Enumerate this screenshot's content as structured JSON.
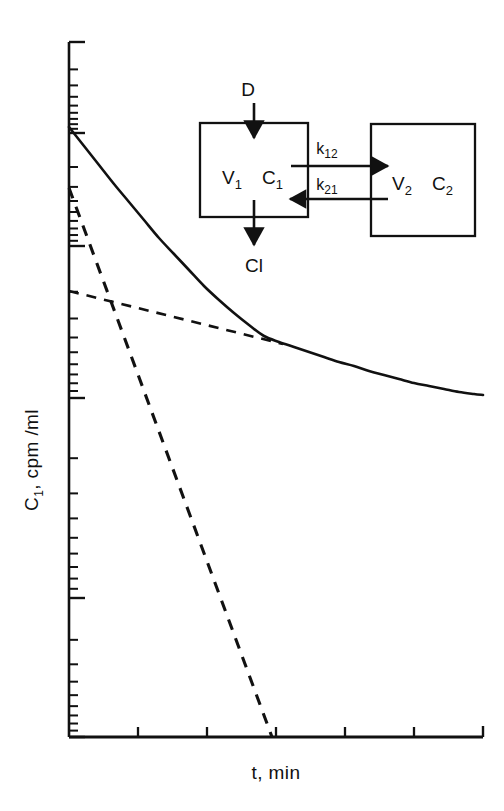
{
  "figure": {
    "background_color": "#ffffff",
    "ink_color": "#111111"
  },
  "axes": {
    "x_label": "t, min",
    "y_label": "C₁, cpm /ml",
    "y_label_main": "C",
    "y_label_sub": "1",
    "y_label_rest": ", cpm /ml",
    "x_tick_count": 5,
    "y_scale": "log",
    "x_scale": "linear",
    "origin_px": [
      69,
      737
    ],
    "x_axis_end_px": [
      483,
      737
    ],
    "y_axis_top_px": [
      69,
      42
    ]
  },
  "chart_data": {
    "type": "line",
    "title": "",
    "xlabel": "t, min",
    "ylabel": "C₁, cpm /ml",
    "y_scale": "log",
    "x_scale": "linear",
    "grid": false,
    "legend": "none",
    "xlim": [
      0,
      1
    ],
    "ylim_log_decades": 5,
    "series": [
      {
        "name": "C1 observed biexponential curve",
        "style": "solid",
        "points_px": [
          [
            69,
            127
          ],
          [
            84,
            146
          ],
          [
            99,
            165
          ],
          [
            114,
            184
          ],
          [
            129,
            202
          ],
          [
            144,
            220
          ],
          [
            159,
            238
          ],
          [
            174,
            254
          ],
          [
            189,
            270
          ],
          [
            204,
            286
          ],
          [
            219,
            300
          ],
          [
            234,
            313
          ],
          [
            249,
            325
          ],
          [
            264,
            336
          ],
          [
            279,
            342
          ],
          [
            294,
            347
          ],
          [
            309,
            352
          ],
          [
            324,
            357
          ],
          [
            339,
            362
          ],
          [
            354,
            366
          ],
          [
            369,
            371
          ],
          [
            384,
            375
          ],
          [
            399,
            379
          ],
          [
            414,
            383
          ],
          [
            429,
            386
          ],
          [
            444,
            389
          ],
          [
            459,
            392
          ],
          [
            474,
            394
          ],
          [
            483,
            395
          ]
        ]
      },
      {
        "name": "alpha distribution phase extrapolation",
        "style": "dashed",
        "points_px": [
          [
            69,
            188
          ],
          [
            272,
            737
          ]
        ]
      },
      {
        "name": "beta elimination phase extrapolation",
        "style": "dashed",
        "points_px": [
          [
            69,
            291
          ],
          [
            283,
            344
          ]
        ]
      }
    ],
    "annotations": [
      {
        "name": "intercept-A-alpha",
        "at_px": [
          69,
          188
        ],
        "note": "zero-time intercept of steep dashed line"
      },
      {
        "name": "intercept-B-beta",
        "at_px": [
          69,
          291
        ],
        "note": "zero-time intercept of shallow dashed line"
      },
      {
        "name": "curve-start",
        "at_px": [
          69,
          127
        ],
        "note": "initial concentration of solid curve"
      }
    ]
  },
  "y_ticks": {
    "long_tick_len": 16,
    "short_tick_len": 9,
    "decades_px": [
      42,
      133,
      246,
      398,
      598,
      737
    ],
    "minor_offsets": [
      0.301,
      0.477,
      0.602,
      0.699,
      0.778,
      0.845,
      0.903,
      0.954
    ]
  },
  "x_ticks": {
    "tick_len": 10,
    "positions_px": [
      138,
      207,
      276,
      345,
      414
    ]
  },
  "diagram": {
    "name": "two-compartment-model",
    "box1": {
      "label_volume": "V",
      "label_volume_sub": "1",
      "label_conc": "C",
      "label_conc_sub": "1",
      "rect_px": [
        200,
        123,
        108,
        94
      ]
    },
    "box2": {
      "label_volume": "V",
      "label_volume_sub": "2",
      "label_conc": "C",
      "label_conc_sub": "2",
      "rect_px": [
        371,
        124,
        104,
        112
      ]
    },
    "input": {
      "label": "D",
      "label_px": [
        248,
        96
      ],
      "arrow_from_px": [
        254,
        103
      ],
      "arrow_to_px": [
        254,
        140
      ]
    },
    "output": {
      "label": "Cl",
      "label_px": [
        244,
        268
      ],
      "arrow_from_px": [
        254,
        200
      ],
      "arrow_to_px": [
        254,
        247
      ]
    },
    "transfer_forward": {
      "label": "k",
      "label_sub": "12",
      "label_px": [
        327,
        154
      ],
      "arrow_from_px": [
        291,
        166
      ],
      "arrow_to_px": [
        390,
        166
      ],
      "direction": "right"
    },
    "transfer_reverse": {
      "label": "k",
      "label_sub": "21",
      "label_px": [
        327,
        188
      ],
      "arrow_from_px": [
        388,
        199
      ],
      "arrow_to_px": [
        288,
        199
      ],
      "direction": "left"
    }
  }
}
